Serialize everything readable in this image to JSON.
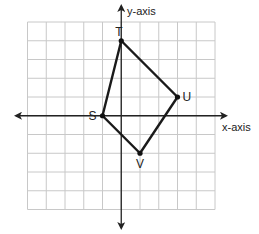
{
  "diagram": {
    "type": "coordinate-grid",
    "x_axis_label": "x-axis",
    "y_axis_label": "y-axis",
    "grid": {
      "x_min": -5,
      "x_max": 5,
      "y_min": -5,
      "y_max": 5,
      "step": 1
    },
    "polygon": {
      "name": "STUV",
      "vertices": [
        {
          "label": "S",
          "x": -1,
          "y": 0
        },
        {
          "label": "T",
          "x": 0,
          "y": 4
        },
        {
          "label": "U",
          "x": 3,
          "y": 1
        },
        {
          "label": "V",
          "x": 1,
          "y": -2
        }
      ]
    },
    "colors": {
      "grid": "#c8c8c8",
      "axis": "#222222",
      "polygon": "#1a1a1a",
      "background": "#ffffff"
    }
  }
}
